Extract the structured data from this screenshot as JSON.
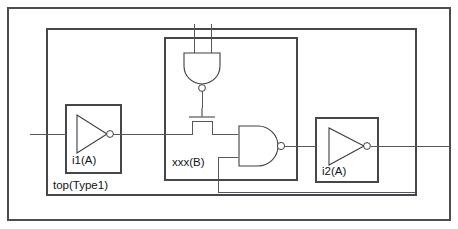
{
  "diagram": {
    "title": "top(Type1)",
    "type": "hierarchical-logic-schematic",
    "canvas": {
      "width": 458,
      "height": 229
    },
    "stroke_color": "#55585c",
    "frame_color": "#4a4d51",
    "text_color": "#111417"
  },
  "blocks": {
    "outer_frame": {
      "name": "outer-frame",
      "x": 8,
      "y": 8,
      "width": 442,
      "height": 212
    },
    "top": {
      "label": "top(Type1)",
      "x": 47,
      "y": 29,
      "width": 369,
      "height": 166,
      "label_x": 53,
      "label_y": 186
    },
    "i1": {
      "label": "i1(A)",
      "x": 66,
      "y": 105,
      "width": 55,
      "height": 68,
      "label_x": 72,
      "label_y": 161
    },
    "xxx": {
      "label": "xxx(B)",
      "x": 165,
      "y": 38,
      "width": 132,
      "height": 142,
      "label_x": 172,
      "label_y": 163
    },
    "i2": {
      "label": "i2(A)",
      "x": 316,
      "y": 118,
      "width": 62,
      "height": 64,
      "label_x": 322,
      "label_y": 172
    }
  },
  "gates": [
    {
      "name": "nand-gate-upper",
      "kind": "nand",
      "orientation": "down",
      "inputs": 2,
      "has_bubble": true,
      "cx": 202,
      "cy": 66
    },
    {
      "name": "nmos-transistor",
      "kind": "nmos",
      "orientation": "up",
      "cx": 202,
      "cy": 126
    },
    {
      "name": "nand-gate-right",
      "kind": "nand",
      "orientation": "right",
      "inputs": 2,
      "has_bubble": true,
      "cx": 258,
      "cy": 146
    },
    {
      "name": "inverter-i1",
      "kind": "inverter",
      "orientation": "right",
      "has_bubble": true,
      "cx": 90,
      "cy": 134
    },
    {
      "name": "inverter-i2",
      "kind": "inverter",
      "orientation": "right",
      "has_bubble": true,
      "cx": 343,
      "cy": 146
    }
  ],
  "nets": [
    {
      "name": "primary-input-net",
      "path": "M 30 134 L 66 134"
    },
    {
      "name": "i1-output-net",
      "path": "M 113 134 L 179 134"
    },
    {
      "name": "nmos-left-terminal-net",
      "path": "M 179 134 L 193 134 L 193 121 L 211 121 L 211 134 L 238 134"
    },
    {
      "name": "nand-upper-input-a-net",
      "path": "M 194 24 L 194 53"
    },
    {
      "name": "nand-upper-input-b-net",
      "path": "M 211 24 L 211 53"
    },
    {
      "name": "nand-upper-output-net",
      "path": "M 202 84 L 202 107"
    },
    {
      "name": "nand-right-input-lower-net",
      "path": "M 218 157 L 238 157"
    },
    {
      "name": "nand-right-feedback-net",
      "path": "M 218 157 L 218 192 L 415 192"
    },
    {
      "name": "nand-right-output-net",
      "path": "M 284 146 L 316 146"
    },
    {
      "name": "i2-output-net",
      "path": "M 370 146 L 450 146"
    }
  ]
}
